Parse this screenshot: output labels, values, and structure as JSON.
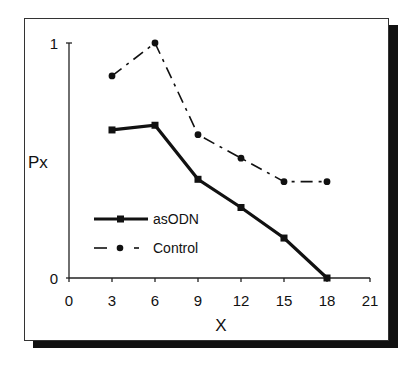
{
  "chart_data": {
    "type": "line",
    "title": "",
    "xlabel": "X",
    "ylabel": "Px",
    "xlim": [
      0,
      21
    ],
    "ylim": [
      0,
      1
    ],
    "x_ticks": [
      "0",
      "3",
      "6",
      "9",
      "12",
      "15",
      "18",
      "21"
    ],
    "y_ticks": [
      "0",
      "1"
    ],
    "grid": false,
    "legend_position": "lower-left-inside",
    "x": [
      3,
      6,
      9,
      12,
      15,
      18
    ],
    "series": [
      {
        "name": "asODN",
        "style": "solid-thick-square-markers",
        "color": "#111111",
        "values": [
          0.63,
          0.65,
          0.42,
          0.3,
          0.17,
          0.0
        ]
      },
      {
        "name": "Control",
        "style": "dash-dot-circle-markers",
        "color": "#111111",
        "values": [
          0.86,
          1.0,
          0.61,
          0.51,
          0.41,
          0.41
        ]
      }
    ]
  },
  "axes": {
    "x_title": "X",
    "y_title": "Px",
    "x_tick_labels": [
      "0",
      "3",
      "6",
      "9",
      "12",
      "15",
      "18",
      "21"
    ],
    "y_tick_labels": [
      "0",
      "1"
    ]
  },
  "legend": {
    "items": [
      {
        "label": "asODN"
      },
      {
        "label": "Control"
      }
    ]
  }
}
